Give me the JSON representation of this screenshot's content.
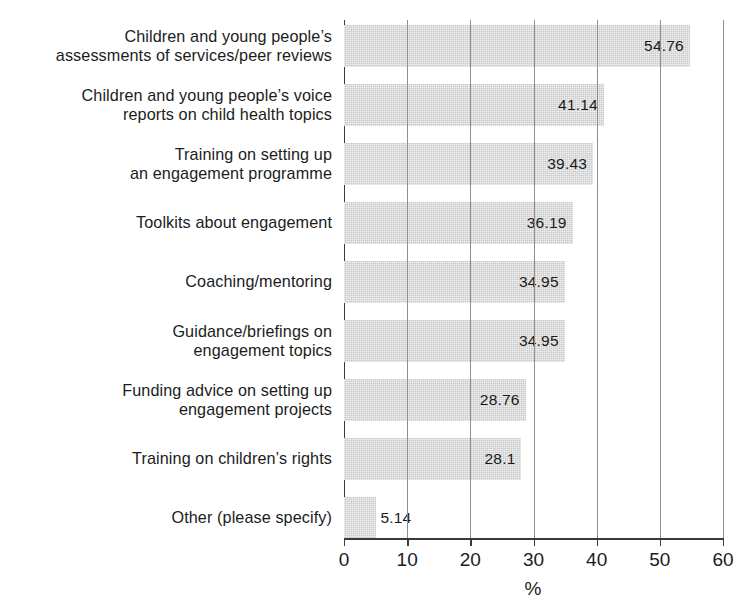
{
  "chart_data": {
    "type": "bar",
    "orientation": "horizontal",
    "title": "",
    "xlabel": "%",
    "ylabel": "",
    "xlim": [
      0,
      60
    ],
    "xticks": [
      0,
      10,
      20,
      30,
      40,
      50,
      60
    ],
    "grid": true,
    "legend": null,
    "bar_color": "#c9c9c9",
    "categories": [
      "Children and young people’s assessments of services/peer reviews",
      "Children and young people’s voice reports on child health topics",
      "Training on setting up an engagement programme",
      "Toolkits about engagement",
      "Coaching/mentoring",
      "Guidance/briefings on engagement topics",
      "Funding advice on setting up engagement projects",
      "Training on children’s rights",
      "Other (please specify)"
    ],
    "values": [
      54.76,
      41.14,
      39.43,
      36.19,
      34.95,
      34.95,
      28.76,
      28.1,
      5.14
    ],
    "value_labels": [
      "54.76",
      "41.14",
      "39.43",
      "36.19",
      "34.95",
      "34.95",
      "28.76",
      "28.1",
      "5.14"
    ],
    "bars": [
      {
        "lines": [
          "Children and young people’s",
          "assessments of services/peer reviews"
        ],
        "value": 54.76,
        "label": "54.76",
        "label_position": "inside"
      },
      {
        "lines": [
          "Children and young people’s voice",
          "reports on child health topics"
        ],
        "value": 41.14,
        "label": "41.14",
        "label_position": "inside"
      },
      {
        "lines": [
          "Training on setting up",
          "an engagement programme"
        ],
        "value": 39.43,
        "label": "39.43",
        "label_position": "inside"
      },
      {
        "lines": [
          "Toolkits about engagement"
        ],
        "value": 36.19,
        "label": "36.19",
        "label_position": "inside"
      },
      {
        "lines": [
          "Coaching/mentoring"
        ],
        "value": 34.95,
        "label": "34.95",
        "label_position": "inside"
      },
      {
        "lines": [
          "Guidance/briefings on",
          "engagement topics"
        ],
        "value": 34.95,
        "label": "34.95",
        "label_position": "inside"
      },
      {
        "lines": [
          "Funding advice on setting up",
          "engagement projects"
        ],
        "value": 28.76,
        "label": "28.76",
        "label_position": "inside"
      },
      {
        "lines": [
          "Training on children’s rights"
        ],
        "value": 28.1,
        "label": "28.1",
        "label_position": "inside"
      },
      {
        "lines": [
          "Other (please specify)"
        ],
        "value": 5.14,
        "label": "5.14",
        "label_position": "outside"
      }
    ],
    "xtick_labels": [
      "0",
      "10",
      "20",
      "30",
      "40",
      "50",
      "60"
    ]
  }
}
